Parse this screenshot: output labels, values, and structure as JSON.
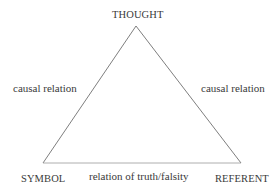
{
  "diagram": {
    "nodes": {
      "top": "THOUGHT",
      "bottom_left": "SYMBOL",
      "bottom_right": "REFERENT"
    },
    "edges": {
      "left": "causal relation",
      "right": "causal relation",
      "bottom": "relation of truth/falsity"
    },
    "line_color": "#777777",
    "text_color": "#3a3a3a"
  }
}
